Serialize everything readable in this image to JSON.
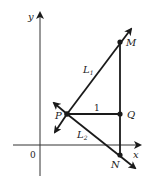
{
  "axes": {
    "x_label": "x",
    "y_label": "y",
    "origin_label": "0"
  },
  "points": {
    "M": "M",
    "P": "P",
    "Q": "Q",
    "N": "N"
  },
  "lines": {
    "L1": "L",
    "L1_sub": "1",
    "L2": "L",
    "L2_sub": "2"
  },
  "segment_label": "1",
  "colors": {
    "stroke": "#1a1a1a",
    "axis": "#333333"
  }
}
